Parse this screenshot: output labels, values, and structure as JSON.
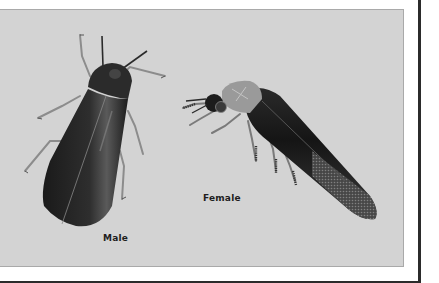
{
  "illustration": {
    "subject": "firefly-beetles",
    "background_color": "#d3d3d3",
    "figures": [
      {
        "id": "male",
        "label": "Male"
      },
      {
        "id": "female",
        "label": "Female"
      }
    ]
  }
}
